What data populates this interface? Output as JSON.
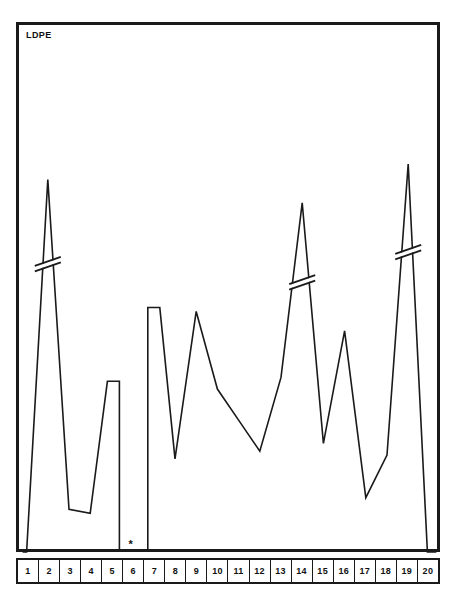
{
  "chart_data": {
    "type": "line",
    "title": "LDPE",
    "xlabel": "",
    "ylabel": "",
    "grid": false,
    "legend": null,
    "categories": [
      "1",
      "2",
      "3",
      "4",
      "5",
      "6",
      "7",
      "8",
      "9",
      "10",
      "11",
      "12",
      "13",
      "14",
      "15",
      "16",
      "17",
      "18",
      "19",
      "20"
    ],
    "axis_break_markers": [
      {
        "at_category": "2",
        "note": "axis-break double-slash on peak"
      },
      {
        "at_category": "14",
        "note": "axis-break double-slash on peak"
      },
      {
        "at_category": "19",
        "note": "axis-break double-slash on peak"
      }
    ],
    "annotations": [
      {
        "symbol": "*",
        "at_category": "6",
        "note": "asterisk below axis at sample 6"
      }
    ],
    "series": [
      {
        "name": "LDPE",
        "values": [
          2,
          96,
          11,
          10,
          44,
          2,
          63,
          24,
          62,
          42,
          34,
          26,
          45,
          90,
          28,
          57,
          14,
          25,
          100,
          2
        ]
      }
    ],
    "ylim": [
      0,
      100
    ],
    "xlim": [
      1,
      20
    ],
    "segments": [
      {
        "note": "left group, samples 1 to 6, drawn as one broken trace"
      },
      {
        "note": "right group, samples 7 to 20, drawn as one broken trace"
      }
    ]
  },
  "figure": {
    "background_color": "#ffffff",
    "line_color": "#1a1a1a",
    "frame_color": "#1a1a1a"
  },
  "axis": {
    "labels": [
      "1",
      "2",
      "3",
      "4",
      "5",
      "6",
      "7",
      "8",
      "9",
      "10",
      "11",
      "12",
      "13",
      "14",
      "15",
      "16",
      "17",
      "18",
      "19",
      "20"
    ]
  },
  "marker": {
    "asterisk": "*"
  }
}
